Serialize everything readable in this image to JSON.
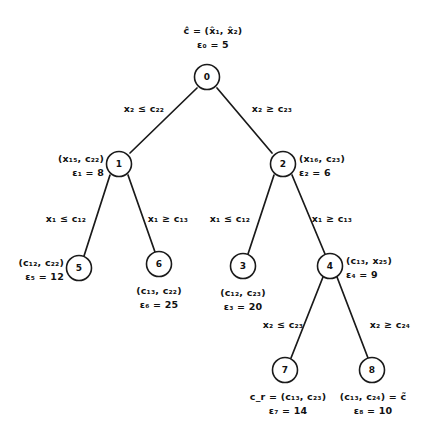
{
  "diagram": {
    "type": "branch-and-bound-tree",
    "title_label": "ĉ = (x̂₁, x̂₂)",
    "root_bound_label": "ε₀ = 5",
    "nodes": [
      {
        "id": "0",
        "x": 207,
        "y": 77,
        "label_line1": "ĉ = (x̂₁, x̂₂)",
        "label_line2": "ε₀ = 5",
        "label_pos": "above-center"
      },
      {
        "id": "1",
        "x": 119,
        "y": 164,
        "label_line1": "(x₁₅, c₂₂)",
        "label_line2": "ε₁ = 8",
        "label_pos": "left"
      },
      {
        "id": "2",
        "x": 283,
        "y": 164,
        "label_line1": "(x₁₆, c₂₃)",
        "label_line2": "ε₂ = 6",
        "label_pos": "right"
      },
      {
        "id": "5",
        "x": 79,
        "y": 268,
        "label_line1": "(c₁₂, c₂₂)",
        "label_line2": "ε₅ = 12",
        "label_pos": "left"
      },
      {
        "id": "6",
        "x": 159,
        "y": 264,
        "label_line1": "(c₁₃, c₂₂)",
        "label_line2": "ε₆ = 25",
        "label_pos": "below-center"
      },
      {
        "id": "3",
        "x": 243,
        "y": 266,
        "label_line1": "(c₁₂, c₂₃)",
        "label_line2": "ε₃ = 20",
        "label_pos": "below-center"
      },
      {
        "id": "4",
        "x": 330,
        "y": 266,
        "label_line1": "(c₁₃, x₂₅)",
        "label_line2": "ε₄ = 9",
        "label_pos": "right"
      },
      {
        "id": "7",
        "x": 285,
        "y": 370,
        "label_line1": "c_r = (c₁₃, c₂₃)",
        "label_line2": "ε₇ = 14",
        "label_pos": "below-center"
      },
      {
        "id": "8",
        "x": 372,
        "y": 370,
        "label_line1": "(c₁₃, c₂₄) = c̃",
        "label_line2": "ε₈ = 10",
        "label_pos": "below-center"
      }
    ],
    "edges": [
      {
        "from": "0",
        "to": "1",
        "label": "x₂ ≤ c₂₂",
        "label_x": 144,
        "label_y": 104
      },
      {
        "from": "0",
        "to": "2",
        "label": "x₂ ≥ c₂₃",
        "label_x": 248,
        "label_y": 104
      },
      {
        "from": "1",
        "to": "5",
        "label": "x₁ ≤ c₁₂",
        "label_x": 41,
        "label_y": 214
      },
      {
        "from": "1",
        "to": "6",
        "label": "x₁ ≥ c₁₃",
        "label_x": 141,
        "label_y": 214
      },
      {
        "from": "2",
        "to": "3",
        "label": "x₁ ≤ c₁₂",
        "label_x": 205,
        "label_y": 214
      },
      {
        "from": "2",
        "to": "4",
        "label": "x₁ ≥ c₁₃",
        "label_x": 305,
        "label_y": 214
      },
      {
        "from": "4",
        "to": "7",
        "label": "x₂ ≤ c₂₃",
        "label_x": 262,
        "label_y": 320
      },
      {
        "from": "4",
        "to": "8",
        "label": "x₂ ≥ c₂₄",
        "label_x": 390,
        "label_y": 320
      }
    ],
    "colors": {
      "ink": "#1a1a1a",
      "paper": "#ffffff"
    }
  }
}
